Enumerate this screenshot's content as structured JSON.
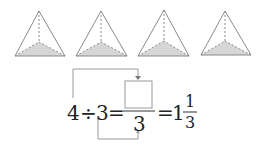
{
  "figure": {
    "shape_count": 4,
    "shape_type": "triangular pyramid (tetrahedron) with shaded base",
    "colors": {
      "edge": "#8a8a8a",
      "base_fill": "#d4d4d4",
      "arrow": "#9a9a9a"
    }
  },
  "equation": {
    "dividend": "4",
    "operator": "÷",
    "divisor": "3",
    "equals1": "=",
    "numerator_box": "",
    "denominator": "3",
    "equals2": "=",
    "whole": "1",
    "frac_num": "1",
    "frac_den": "3"
  }
}
